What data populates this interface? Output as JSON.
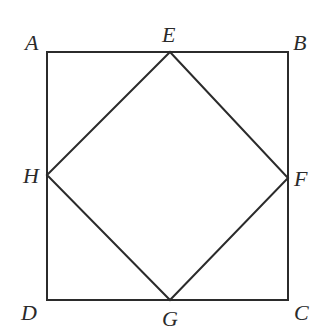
{
  "diagram": {
    "type": "geometry",
    "stroke_color": "#2b2b2b",
    "background": "#ffffff",
    "points": {
      "A": {
        "label": "A",
        "x": 47,
        "y": 52,
        "label_x": 25,
        "label_y": 50
      },
      "B": {
        "label": "B",
        "x": 288,
        "y": 52,
        "label_x": 293,
        "label_y": 50
      },
      "C": {
        "label": "C",
        "x": 288,
        "y": 300,
        "label_x": 294,
        "label_y": 320
      },
      "D": {
        "label": "D",
        "x": 47,
        "y": 300,
        "label_x": 21,
        "label_y": 320
      },
      "E": {
        "label": "E",
        "x": 170,
        "y": 52,
        "label_x": 162,
        "label_y": 42
      },
      "F": {
        "label": "F",
        "x": 288,
        "y": 178,
        "label_x": 294,
        "label_y": 186
      },
      "G": {
        "label": "G",
        "x": 170,
        "y": 300,
        "label_x": 162,
        "label_y": 326
      },
      "H": {
        "label": "H",
        "x": 47,
        "y": 175,
        "label_x": 23,
        "label_y": 183
      }
    },
    "outer_square": [
      "A",
      "B",
      "C",
      "D"
    ],
    "inner_quadrilateral": [
      "E",
      "F",
      "G",
      "H"
    ]
  }
}
